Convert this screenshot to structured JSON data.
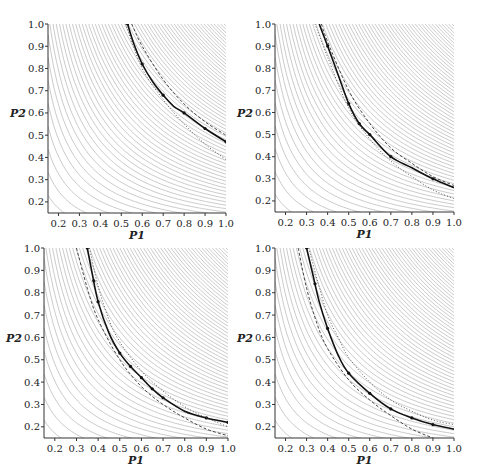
{
  "figure": {
    "width": 481,
    "height": 476,
    "colors": {
      "contour": "#b4b4b4",
      "solid": "#111111",
      "dashed": "#333333",
      "dotted": "#555555",
      "axis": "#333333"
    }
  },
  "chart_data": [
    {
      "type": "line",
      "panel": "top-left",
      "xlabel": "P1",
      "ylabel": "P2",
      "xlim": [
        0.15,
        1.0
      ],
      "ylim": [
        0.15,
        1.0
      ],
      "xticks": [
        "0.2",
        "0.3",
        "0.4",
        "0.5",
        "0.6",
        "0.7",
        "0.8",
        "0.9",
        "1.0"
      ],
      "yticks": [
        "0.2",
        "0.3",
        "0.4",
        "0.5",
        "0.6",
        "0.7",
        "0.8",
        "0.9",
        "1.0"
      ],
      "grid": false,
      "background": "iso-contours",
      "box": {
        "left": 48,
        "top": 24,
        "right": 226,
        "bottom": 213
      },
      "series": [
        {
          "name": "solid",
          "style": "solid",
          "x": [
            0.53,
            0.56,
            0.6,
            0.65,
            0.7,
            0.75,
            0.8,
            0.9,
            1.0
          ],
          "y": [
            1.0,
            0.91,
            0.82,
            0.74,
            0.68,
            0.63,
            0.6,
            0.53,
            0.47
          ],
          "markers": [
            0.53,
            0.6,
            0.7,
            0.8,
            0.9,
            1.0
          ]
        },
        {
          "name": "dashed",
          "style": "dashed",
          "x": [
            0.55,
            0.6,
            0.7,
            0.8,
            0.9,
            1.0
          ],
          "y": [
            1.0,
            0.9,
            0.75,
            0.64,
            0.56,
            0.5
          ]
        },
        {
          "name": "dotted",
          "style": "dotted",
          "x": [
            0.52,
            0.6,
            0.7,
            0.8,
            0.9,
            1.0
          ],
          "y": [
            1.0,
            0.8,
            0.66,
            0.55,
            0.46,
            0.39
          ]
        }
      ]
    },
    {
      "type": "line",
      "panel": "top-right",
      "xlabel": "P1",
      "ylabel": "P2",
      "xlim": [
        0.15,
        1.0
      ],
      "ylim": [
        0.15,
        1.0
      ],
      "xticks": [
        "0.2",
        "0.3",
        "0.4",
        "0.5",
        "0.6",
        "0.7",
        "0.8",
        "0.9",
        "1.0"
      ],
      "yticks": [
        "0.2",
        "0.3",
        "0.4",
        "0.5",
        "0.6",
        "0.7",
        "0.8",
        "0.9",
        "1.0"
      ],
      "grid": false,
      "background": "iso-contours",
      "box": {
        "left": 275,
        "top": 24,
        "right": 454,
        "bottom": 212
      },
      "series": [
        {
          "name": "solid",
          "style": "solid",
          "x": [
            0.36,
            0.4,
            0.45,
            0.5,
            0.55,
            0.6,
            0.7,
            0.8,
            0.9,
            1.0
          ],
          "y": [
            1.0,
            0.9,
            0.77,
            0.64,
            0.55,
            0.5,
            0.4,
            0.35,
            0.3,
            0.26
          ],
          "markers": [
            0.4,
            0.5,
            0.55,
            0.6,
            0.7,
            0.9
          ]
        },
        {
          "name": "dashed",
          "style": "dashed",
          "x": [
            0.37,
            0.4,
            0.5,
            0.6,
            0.7,
            0.8,
            0.9,
            1.0
          ],
          "y": [
            1.0,
            0.92,
            0.7,
            0.55,
            0.44,
            0.37,
            0.31,
            0.27
          ]
        },
        {
          "name": "dotted",
          "style": "dotted",
          "x": [
            0.34,
            0.4,
            0.5,
            0.6,
            0.7,
            0.8,
            0.9,
            1.0
          ],
          "y": [
            1.0,
            0.85,
            0.62,
            0.48,
            0.38,
            0.31,
            0.25,
            0.21
          ]
        }
      ]
    },
    {
      "type": "line",
      "panel": "bottom-left",
      "xlabel": "P1",
      "ylabel": "P2",
      "xlim": [
        0.15,
        1.0
      ],
      "ylim": [
        0.15,
        1.0
      ],
      "xticks": [
        "0.2",
        "0.3",
        "0.4",
        "0.5",
        "0.6",
        "0.7",
        "0.8",
        "0.9",
        "1.0"
      ],
      "yticks": [
        "0.2",
        "0.3",
        "0.4",
        "0.5",
        "0.6",
        "0.7",
        "0.8",
        "0.9",
        "1.0"
      ],
      "grid": false,
      "background": "iso-contours",
      "box": {
        "left": 44,
        "top": 248,
        "right": 228,
        "bottom": 438
      },
      "series": [
        {
          "name": "solid",
          "style": "solid",
          "x": [
            0.35,
            0.37,
            0.4,
            0.45,
            0.5,
            0.55,
            0.6,
            0.65,
            0.7,
            0.8,
            0.9,
            1.0
          ],
          "y": [
            1.0,
            0.9,
            0.76,
            0.62,
            0.53,
            0.47,
            0.42,
            0.37,
            0.33,
            0.27,
            0.24,
            0.22
          ],
          "markers": [
            0.35,
            0.38,
            0.4,
            0.5,
            0.55,
            0.6,
            0.65,
            0.7,
            0.9,
            1.0
          ]
        },
        {
          "name": "dashed",
          "style": "dashed",
          "x": [
            0.3,
            0.35,
            0.4,
            0.5,
            0.6,
            0.7,
            0.8,
            0.9,
            1.0
          ],
          "y": [
            1.0,
            0.82,
            0.68,
            0.5,
            0.38,
            0.3,
            0.24,
            0.19,
            0.16
          ]
        },
        {
          "name": "dotted",
          "style": "dotted",
          "x": [
            0.36,
            0.4,
            0.45,
            0.5,
            0.6,
            0.7,
            0.8,
            0.9,
            1.0
          ],
          "y": [
            1.0,
            0.83,
            0.68,
            0.58,
            0.45,
            0.36,
            0.29,
            0.24,
            0.2
          ]
        }
      ]
    },
    {
      "type": "line",
      "panel": "bottom-right",
      "xlabel": "P1",
      "ylabel": "P2",
      "xlim": [
        0.15,
        1.0
      ],
      "ylim": [
        0.15,
        1.0
      ],
      "xticks": [
        "0.2",
        "0.3",
        "0.4",
        "0.5",
        "0.6",
        "0.7",
        "0.8",
        "0.9",
        "1.0"
      ],
      "yticks": [
        "0.2",
        "0.3",
        "0.4",
        "0.5",
        "0.6",
        "0.7",
        "0.8",
        "0.9",
        "1.0"
      ],
      "grid": false,
      "background": "iso-contours",
      "box": {
        "left": 275,
        "top": 248,
        "right": 454,
        "bottom": 438
      },
      "series": [
        {
          "name": "solid",
          "style": "solid",
          "x": [
            0.3,
            0.33,
            0.36,
            0.4,
            0.45,
            0.5,
            0.6,
            0.7,
            0.8,
            0.9,
            1.0
          ],
          "y": [
            1.0,
            0.88,
            0.76,
            0.64,
            0.52,
            0.44,
            0.35,
            0.28,
            0.24,
            0.21,
            0.19
          ],
          "markers": [
            0.3,
            0.34,
            0.4,
            0.5,
            0.6,
            0.7,
            0.8,
            0.9
          ]
        },
        {
          "name": "dashed",
          "style": "dashed",
          "x": [
            0.26,
            0.3,
            0.35,
            0.4,
            0.5,
            0.6,
            0.7,
            0.8,
            0.9
          ],
          "y": [
            1.0,
            0.82,
            0.66,
            0.55,
            0.41,
            0.32,
            0.25,
            0.19,
            0.15
          ]
        },
        {
          "name": "dotted",
          "style": "dotted",
          "x": [
            0.31,
            0.35,
            0.4,
            0.45,
            0.5,
            0.6,
            0.7,
            0.8,
            0.9,
            1.0
          ],
          "y": [
            1.0,
            0.86,
            0.7,
            0.6,
            0.51,
            0.4,
            0.32,
            0.27,
            0.23,
            0.21
          ]
        }
      ]
    }
  ]
}
